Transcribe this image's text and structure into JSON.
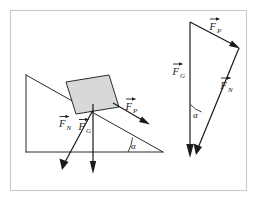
{
  "figure": {
    "background_color": "#ffffff",
    "frame_color": "#c9c9c9",
    "ink_color": "#1a1a1a",
    "block_fill_color": "#d8d8d8"
  },
  "incline": {
    "name": "inclined-plane",
    "angle_label": "α",
    "apex_top": [
      26,
      75
    ],
    "base_left": [
      26,
      152
    ],
    "base_right": [
      163,
      152
    ],
    "block": {
      "fill": "#d8d8d8",
      "stroke": "#2b2b2b"
    },
    "forces": [
      {
        "key": "normal",
        "symbol": "F",
        "subscript": "N",
        "label": "F_N",
        "direction": "down-left perpendicular to incline surface"
      },
      {
        "key": "gravity",
        "symbol": "F",
        "subscript": "G",
        "label": "F_G",
        "direction": "straight down"
      },
      {
        "key": "parallel",
        "symbol": "F",
        "subscript": "P",
        "label": "F_P",
        "direction": "down the slope"
      }
    ]
  },
  "force_triangle": {
    "name": "force-triangle",
    "angle_label": "α",
    "apex_top": [
      190,
      22
    ],
    "corner_right": [
      239,
      48
    ],
    "arrow_bottom": [
      196,
      157
    ],
    "forces": [
      {
        "key": "gravity",
        "symbol": "F",
        "subscript": "G",
        "label": "F_G",
        "direction": "vertical downward"
      },
      {
        "key": "parallel",
        "symbol": "F",
        "subscript": "P",
        "label": "F_P",
        "direction": "down and to the right along top edge"
      },
      {
        "key": "normal",
        "symbol": "F",
        "subscript": "N",
        "label": "F_N",
        "direction": "down and to the left along hypotenuse"
      }
    ]
  },
  "labels": {
    "F": "F",
    "sub_N": "N",
    "sub_G": "G",
    "sub_P": "P",
    "alpha": "α"
  }
}
